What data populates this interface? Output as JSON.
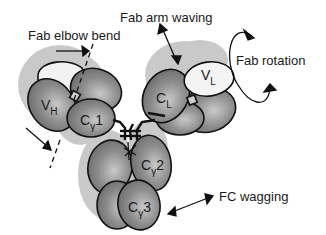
{
  "diagram": {
    "motions": [
      {
        "id": "fab-elbow-bend",
        "label": "Fab elbow bend"
      },
      {
        "id": "fab-arm-waving",
        "label": "Fab arm waving"
      },
      {
        "id": "fab-rotation",
        "label": "Fab rotation"
      },
      {
        "id": "fc-wagging",
        "label": "FC wagging"
      }
    ],
    "domains": [
      {
        "id": "vh",
        "main": "V",
        "sub": "H"
      },
      {
        "id": "cg1",
        "main": "C",
        "sub": "γ",
        "num": "1"
      },
      {
        "id": "cl",
        "main": "C",
        "sub": "L"
      },
      {
        "id": "vl",
        "main": "V",
        "sub": "L"
      },
      {
        "id": "cg2",
        "main": "C",
        "sub": "γ",
        "num": "2"
      },
      {
        "id": "cg3",
        "main": "C",
        "sub": "γ",
        "num": "3"
      }
    ],
    "colors": {
      "shadow": "#c8c8c8",
      "heavy_domain": "#8f8f8f",
      "light_domain": "#f2f2f2",
      "outline": "#111111"
    }
  }
}
